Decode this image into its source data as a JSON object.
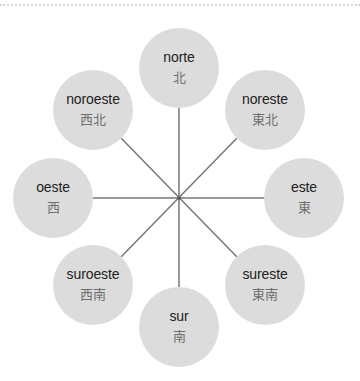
{
  "diagram": {
    "type": "compass-rose",
    "hub": {
      "x": 179,
      "y": 198
    },
    "line_color": "#777777",
    "node_color": "#dcdcdc",
    "nodes": [
      {
        "id": "n",
        "es": "norte",
        "zh": "北",
        "x": 179,
        "y": 68
      },
      {
        "id": "ne",
        "es": "noreste",
        "zh": "東北",
        "x": 265,
        "y": 110
      },
      {
        "id": "e",
        "es": "este",
        "zh": "東",
        "x": 304,
        "y": 198
      },
      {
        "id": "se",
        "es": "sureste",
        "zh": "東南",
        "x": 265,
        "y": 285
      },
      {
        "id": "s",
        "es": "sur",
        "zh": "南",
        "x": 179,
        "y": 327
      },
      {
        "id": "sw",
        "es": "suroeste",
        "zh": "西南",
        "x": 93,
        "y": 285
      },
      {
        "id": "w",
        "es": "oeste",
        "zh": "西",
        "x": 53,
        "y": 198
      },
      {
        "id": "nw",
        "es": "noroeste",
        "zh": "西北",
        "x": 93,
        "y": 110
      }
    ]
  }
}
